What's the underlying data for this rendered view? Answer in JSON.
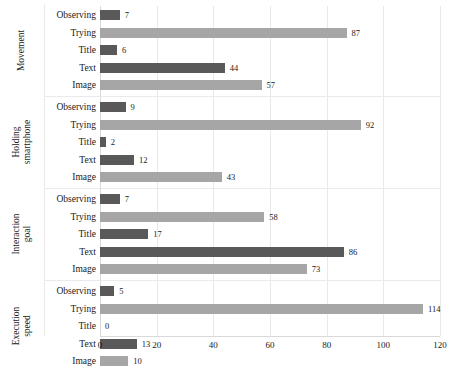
{
  "chart_data": {
    "type": "bar",
    "orientation": "horizontal",
    "title": "",
    "xlabel": "",
    "ylabel": "",
    "xlim": [
      0,
      120
    ],
    "xticks": [
      0,
      20,
      40,
      60,
      80,
      100,
      120
    ],
    "xticklabels": [
      "0",
      "20",
      "40",
      "60",
      "80",
      "100",
      "120"
    ],
    "grid": "vertical",
    "legend": "none",
    "colors": {
      "dark": "#595959",
      "light": "#a6a6a6"
    },
    "groups": [
      {
        "name": "Movement",
        "categories": [
          "Observing",
          "Trying",
          "Title",
          "Text",
          "Image"
        ],
        "values": [
          7,
          87,
          6,
          44,
          57
        ],
        "shades": [
          "dark",
          "light",
          "dark",
          "dark",
          "light"
        ]
      },
      {
        "name": "Holding smartphone",
        "categories": [
          "Observing",
          "Trying",
          "Title",
          "Text",
          "Image"
        ],
        "values": [
          9,
          92,
          2,
          12,
          43
        ],
        "shades": [
          "dark",
          "light",
          "dark",
          "dark",
          "light"
        ]
      },
      {
        "name": "Interaction goal",
        "categories": [
          "Observing",
          "Trying",
          "Title",
          "Text",
          "Image"
        ],
        "values": [
          7,
          58,
          17,
          86,
          73
        ],
        "shades": [
          "dark",
          "light",
          "dark",
          "dark",
          "light"
        ]
      },
      {
        "name": "Execution speed",
        "categories": [
          "Observing",
          "Trying",
          "Title",
          "Text",
          "Image"
        ],
        "values": [
          5,
          114,
          0,
          13,
          10
        ],
        "shades": [
          "dark",
          "light",
          "dark",
          "dark",
          "light"
        ]
      }
    ]
  }
}
